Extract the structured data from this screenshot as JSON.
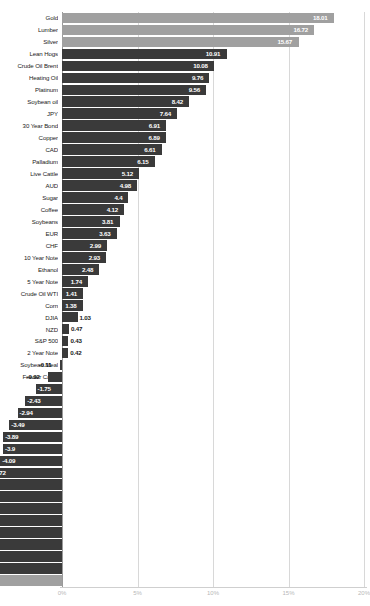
{
  "chart": {
    "title": "",
    "type": "bar"
  },
  "axis": {
    "ticks": [
      "0%",
      "5%",
      "10%",
      "15%",
      "20%"
    ],
    "tick_values": [
      0,
      5,
      10,
      15,
      20
    ]
  },
  "chart_data": {
    "type": "bar",
    "orientation": "horizontal",
    "title": "",
    "xlabel": "",
    "ylabel": "",
    "xlim": [
      -20,
      20
    ],
    "grid": true,
    "legend": "none",
    "categories": [
      "Gold",
      "Lumber",
      "Silver",
      "Lean Hogs",
      "Crude Oil Brent",
      "Heating Oil",
      "Platinum",
      "Soybean oil",
      "JPY",
      "30 Year Bond",
      "Copper",
      "CAD",
      "Palladium",
      "Live Cattle",
      "AUD",
      "Sugar",
      "Coffee",
      "Soybeans",
      "EUR",
      "CHF",
      "10 Year Note",
      "Ethanol",
      "5 Year Note",
      "Crude Oil WTI",
      "Corn",
      "DJIA",
      "NZD",
      "S&P 500",
      "2 Year Note",
      "Soybean Meal",
      "Feeder Cattle",
      "GBP",
      "Cocoa",
      "Wheat",
      "Russell 2000",
      "Nasdaq 100",
      "USD",
      "Canola",
      "VIX",
      "Gasoline RBOB",
      "Euro Stoxx 50",
      "DAX",
      "Cotton",
      "Nikkei 225",
      "Orange Juice",
      "Oats",
      "Rough Rice",
      "Natural Gas"
    ],
    "values": [
      18.01,
      16.72,
      15.67,
      10.91,
      10.08,
      9.76,
      9.56,
      8.42,
      7.64,
      6.91,
      6.89,
      6.61,
      6.15,
      5.12,
      4.98,
      4.4,
      4.12,
      3.81,
      3.63,
      2.99,
      2.93,
      2.48,
      1.74,
      1.41,
      1.38,
      1.03,
      0.47,
      0.43,
      0.42,
      -0.11,
      -0.92,
      -1.75,
      -2.43,
      -2.94,
      -3.49,
      -3.89,
      -3.9,
      -4.09,
      -4.72,
      -6.68,
      -7.25,
      -8.19,
      -9.63,
      -11.47,
      -11.7,
      -12.49,
      -12.76,
      -19.37
    ],
    "value_labels": [
      "18.01",
      "16.72",
      "15.67",
      "10.91",
      "10.08",
      "9.76",
      "9.56",
      "8.42",
      "7.64",
      "6.91",
      "6.89",
      "6.61",
      "6.15",
      "5.12",
      "4.98",
      "4.4",
      "4.12",
      "3.81",
      "3.63",
      "2.99",
      "2.93",
      "2.48",
      "1.74",
      "1.41",
      "1.38",
      "1.03",
      "0.47",
      "0.43",
      "0.42",
      "-0.11",
      "-0.92",
      "-1.75",
      "-2.43",
      "-2.94",
      "-3.49",
      "-3.89",
      "-3.9",
      "-4.09",
      "-4.72",
      "-6.68",
      "-7.25",
      "-8.19",
      "-9.63",
      "-11.47",
      "-11.7",
      "-12.49",
      "-12.76",
      "-19.37"
    ],
    "bar_styles": [
      "light",
      "light",
      "light",
      "dark",
      "dark",
      "dark",
      "dark",
      "dark",
      "dark",
      "dark",
      "dark",
      "dark",
      "dark",
      "dark",
      "dark",
      "dark",
      "dark",
      "dark",
      "dark",
      "dark",
      "dark",
      "dark",
      "dark",
      "dark",
      "dark",
      "dark",
      "dark",
      "dark",
      "dark",
      "dark",
      "dark",
      "dark",
      "dark",
      "dark",
      "dark",
      "dark",
      "dark",
      "dark",
      "dark",
      "dark",
      "dark",
      "dark",
      "dark",
      "dark",
      "dark",
      "dark",
      "dark",
      "light"
    ]
  },
  "colors": {
    "bar_light": "#a0a0a0",
    "bar_dark": "#3a3a3a",
    "gridline": "#d8d8d8",
    "zeroline": "#9a9a9a",
    "tick_text": "#b8b8b8",
    "label_text": "#1a1a1a"
  }
}
